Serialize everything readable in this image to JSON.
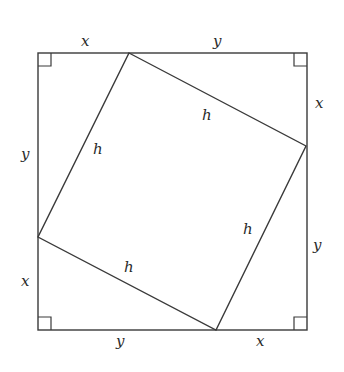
{
  "diagram": {
    "type": "geometry-proof",
    "stroke_color": "#3a3a3a",
    "outer_square": {
      "x1": 38,
      "y1": 53,
      "x2": 307,
      "y2": 330
    },
    "inner_square": {
      "points": [
        [
          129,
          53
        ],
        [
          306,
          146
        ],
        [
          216,
          330
        ],
        [
          38,
          237
        ]
      ]
    },
    "labels": {
      "top_left": "x",
      "top_right": "y",
      "right_top": "x",
      "right_bottom": "y",
      "bottom_right": "x",
      "bottom_left": "y",
      "left_bottom": "x",
      "left_top": "y",
      "hyp_top": "h",
      "hyp_right": "h",
      "hyp_bottom": "h",
      "hyp_left": "h"
    }
  }
}
